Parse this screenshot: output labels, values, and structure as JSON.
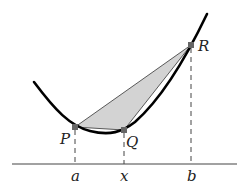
{
  "diagram": {
    "points": {
      "P": {
        "label": "P",
        "x": 75,
        "y": 127
      },
      "Q": {
        "label": "Q",
        "x": 124,
        "y": 130
      },
      "R": {
        "label": "R",
        "x": 191,
        "y": 45
      }
    },
    "axis_labels": {
      "a": "a",
      "x": "x",
      "b": "b"
    },
    "colors": {
      "curve": "#000000",
      "fill": "#d3d3d3",
      "point": "#666666",
      "line": "#222222"
    }
  }
}
